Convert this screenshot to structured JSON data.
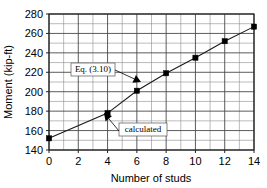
{
  "chart_data": {
    "type": "line",
    "title": "",
    "xlabel": "Number of studs",
    "ylabel": "Moment (kip-ft)",
    "xlim": [
      0,
      14
    ],
    "ylim": [
      140,
      280
    ],
    "x_major_step": 2,
    "x_minor_step": 1,
    "y_major_step": 20,
    "y_minor_step": 10,
    "grid": "on",
    "legend": "none",
    "x_tick_labels": [
      "0",
      "2",
      "4",
      "6",
      "8",
      "10",
      "12",
      "14"
    ],
    "y_tick_labels": [
      "140",
      "160",
      "180",
      "200",
      "220",
      "240",
      "260",
      "280"
    ],
    "series": [
      {
        "name": "Eq. (3.10)",
        "marker": "filled-square",
        "x": [
          0,
          4,
          6,
          8,
          10,
          12,
          14
        ],
        "values": [
          152,
          178,
          201,
          219,
          235,
          252,
          267
        ]
      }
    ],
    "annotations": [
      {
        "id": "eq-annotation",
        "label": "Eq. (3.10)",
        "box_x": 71,
        "box_y": 63,
        "box_w": 44,
        "box_h": 13,
        "arrow_from_x": 115,
        "arrow_from_y": 70,
        "arrow_to_x": 141,
        "arrow_to_y": 82
      },
      {
        "id": "calculated-annotation",
        "label": "calculated",
        "box_x": 119,
        "box_y": 123,
        "box_w": 48,
        "box_h": 13,
        "arrow_from_x": 119,
        "arrow_from_y": 131,
        "arrow_to_x": 104,
        "arrow_to_y": 113
      }
    ]
  },
  "figure": {
    "background_color": "#ffffff",
    "axis_color": "#222222",
    "grid_major_color": "#4a4a4a",
    "grid_minor_color": "#8d8d8d",
    "series_color": "#1a1a1a",
    "marker_color": "#000000"
  }
}
